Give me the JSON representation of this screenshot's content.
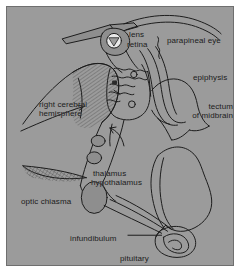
{
  "figure": {
    "background_color": "#9b9b9b",
    "border_color": "#6f6f6f",
    "ink_color": "#1b1b1b",
    "margin_color": "#ffffff"
  },
  "labels": [
    {
      "id": "lens",
      "text": "lens",
      "x": 122,
      "y": 23,
      "align": "left"
    },
    {
      "id": "retina",
      "text": "retina",
      "x": 120,
      "y": 33,
      "align": "left"
    },
    {
      "id": "parapineal-eye",
      "text": "parapineal eye",
      "x": 160,
      "y": 29,
      "align": "left"
    },
    {
      "id": "epiphysis",
      "text": "epiphysis",
      "x": 186,
      "y": 66,
      "align": "left"
    },
    {
      "id": "right-cerebral-hemisphere",
      "text": "right cerebral\nhemisphere",
      "x": 32,
      "y": 93,
      "align": "left"
    },
    {
      "id": "tectum-of-midbrain",
      "text": "tectum\nof midbrain",
      "x": 171,
      "y": 95,
      "align": "left"
    },
    {
      "id": "thalamus",
      "text": "thalamus",
      "x": 86,
      "y": 162,
      "align": "left"
    },
    {
      "id": "hypothalamus",
      "text": "hypothalamus",
      "x": 84,
      "y": 171,
      "align": "left"
    },
    {
      "id": "optic-chiasma",
      "text": "optic chiasma",
      "x": 14,
      "y": 190,
      "align": "left"
    },
    {
      "id": "infundibulum",
      "text": "infundibulum",
      "x": 63,
      "y": 227,
      "align": "left"
    },
    {
      "id": "pituitary",
      "text": "pituitary",
      "x": 113,
      "y": 247,
      "align": "left"
    }
  ],
  "structures": [
    {
      "id": "parapineal-stalk",
      "name": "parapineal stalk band"
    },
    {
      "id": "parapineal-vesicle",
      "name": "parapineal eye vesicle"
    },
    {
      "id": "lens-body",
      "name": "lens"
    },
    {
      "id": "epiphysis-body",
      "name": "epiphysis / pineal organ"
    },
    {
      "id": "cerebral-hemisphere",
      "name": "right cerebral hemisphere"
    },
    {
      "id": "habenula",
      "name": "habenular / choroid folds"
    },
    {
      "id": "tectum-outline",
      "name": "tectum of midbrain"
    },
    {
      "id": "thalamus-body",
      "name": "thalamus and hypothalamus"
    },
    {
      "id": "optic-tract",
      "name": "optic tract to chiasma"
    },
    {
      "id": "optic-chiasma-body",
      "name": "optic chiasma"
    },
    {
      "id": "infundibulum-stalk",
      "name": "infundibulum"
    },
    {
      "id": "pituitary-coil",
      "name": "pituitary"
    },
    {
      "id": "hindbrain-lobe",
      "name": "hindbrain lobe"
    }
  ],
  "leaders": [
    {
      "id": "leader-hemisphere",
      "from": "right-cerebral-hemisphere"
    },
    {
      "id": "leader-infundibulum",
      "from": "infundibulum"
    },
    {
      "id": "leader-parapineal",
      "from": "parapineal-eye"
    },
    {
      "id": "leader-arrow-mid",
      "from": "midline-arrow"
    }
  ]
}
